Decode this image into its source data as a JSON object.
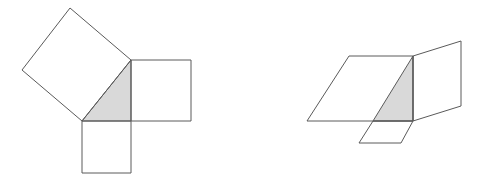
{
  "colors": {
    "background": "#ffffff",
    "stroke": "#5a5a5a",
    "triangle_fill": "#d9d9d9"
  },
  "figures": [
    {
      "name": "pythagoras-squares",
      "triangle": "82,121 131,60 131,121",
      "shapes": [
        {
          "name": "hypotenuse-square",
          "points": "82,121 131,60 70,8 22,70"
        },
        {
          "name": "vertical-leg-square",
          "points": "131,60 191,60 191,121 131,121"
        },
        {
          "name": "horizontal-leg-square",
          "points": "82,121 131,121 131,173 82,173"
        }
      ]
    },
    {
      "name": "sheared-parallelograms",
      "triangle": "373,121 413,56 413,121",
      "shapes": [
        {
          "name": "hypotenuse-parallelogram",
          "points": "307,121 349,56 413,56 413,121"
        },
        {
          "name": "vertical-leg-parallelogram",
          "points": "413,56 461,41 461,106 413,121"
        },
        {
          "name": "horizontal-leg-parallelogram",
          "points": "373,121 413,121 401,143 359,143"
        }
      ]
    }
  ]
}
